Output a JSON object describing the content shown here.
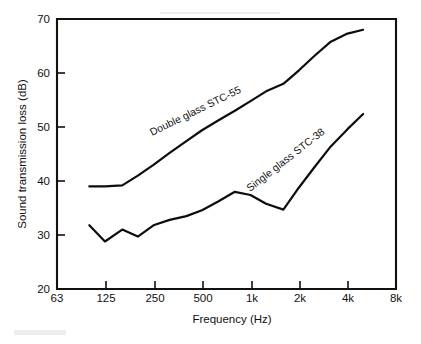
{
  "figure": {
    "background_color": "#ffffff",
    "line_color": "#0d0d0d"
  },
  "chart_data": {
    "type": "line",
    "title": "",
    "xlabel": "Frequency (Hz)",
    "ylabel": "Sound transmission loss (dB)",
    "x_tick_labels": [
      "63",
      "125",
      "250",
      "500",
      "1k",
      "2k",
      "4k",
      "8k"
    ],
    "x_tick_values": [
      63,
      125,
      250,
      500,
      1000,
      2000,
      4000,
      8000
    ],
    "y_tick_labels": [
      "20",
      "30",
      "40",
      "50",
      "60",
      "70"
    ],
    "y_tick_values": [
      20,
      30,
      40,
      50,
      60,
      70
    ],
    "ylim": [
      20,
      70
    ],
    "xlim": [
      63,
      8000
    ],
    "x_scale": "log",
    "grid": false,
    "legend": "inline-curve-labels",
    "series": [
      {
        "name": "Double glass STC-55",
        "label": "Double glass STC-55",
        "label_rotation_deg": -26,
        "x": [
          100,
          125,
          160,
          200,
          250,
          315,
          400,
          500,
          630,
          800,
          1000,
          1250,
          1600,
          2000,
          2500,
          3150,
          4000,
          5000
        ],
        "values": [
          39.0,
          39.0,
          39.2,
          41.0,
          43.0,
          45.2,
          47.4,
          49.4,
          51.2,
          53.0,
          54.8,
          56.6,
          58.0,
          60.5,
          63.2,
          65.8,
          67.3,
          68.0
        ]
      },
      {
        "name": "Single glass STC-38",
        "label": "Single glass STC-38",
        "label_rotation_deg": -38,
        "x": [
          100,
          125,
          160,
          200,
          250,
          315,
          400,
          500,
          630,
          800,
          1000,
          1250,
          1600,
          2000,
          2500,
          3150,
          4000,
          5000
        ],
        "values": [
          31.8,
          28.8,
          31.0,
          29.7,
          31.8,
          32.8,
          33.5,
          34.6,
          36.2,
          38.0,
          37.4,
          35.8,
          34.7,
          38.8,
          42.6,
          46.4,
          49.6,
          52.4
        ]
      }
    ]
  },
  "annotations": {
    "double_glass_label": "Double glass STC-55",
    "single_glass_label": "Single glass STC-38"
  }
}
